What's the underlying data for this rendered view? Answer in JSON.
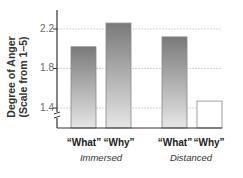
{
  "chart_data": {
    "type": "bar",
    "title": "",
    "xlabel": "",
    "ylabel": "Degree of Anger (Scale from 1–5)",
    "ylabel_lines": [
      "Degree of Anger",
      "(Scale from 1–5)"
    ],
    "ylim": [
      1.2,
      2.3
    ],
    "yticks": [
      "1.4",
      "1.8",
      "2.2"
    ],
    "grid": true,
    "axis_break": true,
    "groups": [
      "Immersed",
      "Distanced"
    ],
    "categories": [
      "“What”",
      "“Why”",
      "“What”",
      "“Why”"
    ],
    "bars": [
      {
        "group": "Immersed",
        "label": "“What”",
        "value": 2.02,
        "style": "gradient"
      },
      {
        "group": "Immersed",
        "label": "“Why”",
        "value": 2.26,
        "style": "gradient"
      },
      {
        "group": "Distanced",
        "label": "“What”",
        "value": 2.12,
        "style": "gradient"
      },
      {
        "group": "Distanced",
        "label": "“Why”",
        "value": 1.47,
        "style": "white"
      }
    ],
    "values": [
      2.02,
      2.26,
      2.12,
      1.47
    ],
    "legend": null
  },
  "colors": {
    "gradient_dark": "#7a7a7a",
    "gradient_light": "#e6e6e6",
    "white_bar_fill": "#ffffff",
    "bar_stroke": "#888888",
    "axis": "#333333",
    "grid": "#c8c8c8"
  }
}
